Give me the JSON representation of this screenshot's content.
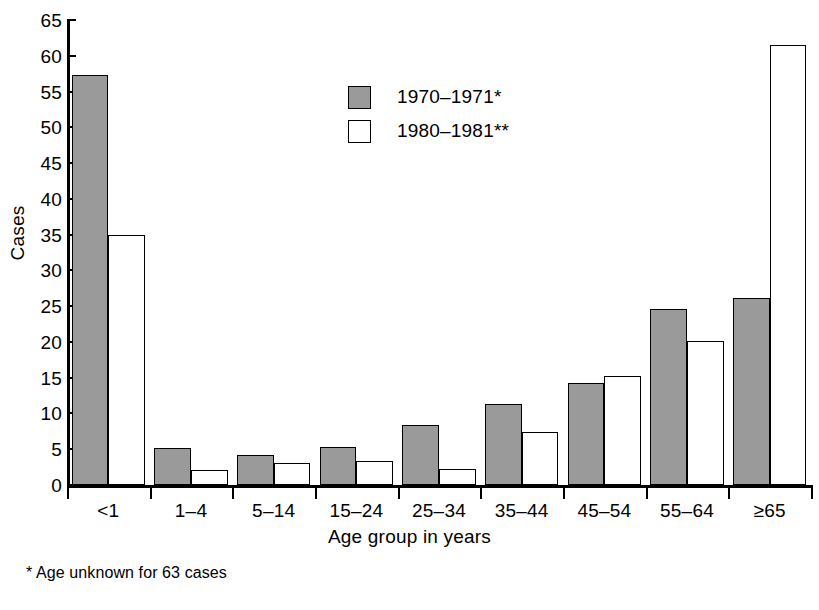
{
  "chart_data": {
    "type": "bar",
    "title": "",
    "xlabel": "Age group in years",
    "ylabel": "Cases",
    "categories": [
      "<1",
      "1–4",
      "5–14",
      "15–24",
      "25–34",
      "35–44",
      "45–54",
      "55–64",
      "≥65"
    ],
    "series": [
      {
        "name": "1970–1971*",
        "color": "#9a9a9b",
        "values": [
          57.3,
          5.2,
          4.2,
          5.3,
          8.4,
          11.3,
          14.2,
          24.6,
          26.2
        ]
      },
      {
        "name": "1980–1981**",
        "color": "#ffffff",
        "values": [
          35.0,
          2.1,
          3.1,
          3.3,
          2.2,
          7.4,
          15.3,
          20.2,
          61.5
        ]
      }
    ],
    "ylim": [
      0,
      65
    ],
    "yticks": [
      0,
      5,
      10,
      15,
      20,
      25,
      30,
      35,
      40,
      45,
      50,
      55,
      60,
      65
    ],
    "ytick_labels": [
      "0",
      "5",
      "10",
      "15",
      "20",
      "25",
      "30",
      "35",
      "40",
      "45",
      "50",
      "55",
      "60",
      "65"
    ],
    "grid": false,
    "legend_position": "upper-center-inside"
  },
  "axes": {
    "y_title": "Cases",
    "x_title": "Age group in years"
  },
  "legend": {
    "entries": [
      {
        "label": "1970–1971*",
        "swatch": "gray"
      },
      {
        "label": "1980–1981**",
        "swatch": "white"
      }
    ]
  },
  "footnotes": [
    "* Age unknown for 63 cases"
  ]
}
